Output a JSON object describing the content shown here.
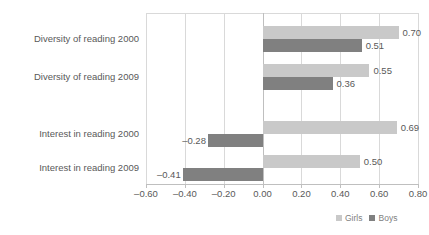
{
  "chart_data": {
    "type": "bar",
    "orientation": "horizontal",
    "title": "",
    "subtitle": "",
    "xlabel": "",
    "ylabel": "",
    "categories": [
      "Diversity of reading 2000",
      "Diversity of reading 2009",
      "Interest in reading 2000",
      "Interest in reading 2009"
    ],
    "series": [
      {
        "name": "Girls",
        "color": "#c9c9c9",
        "values": [
          0.7,
          0.55,
          0.69,
          0.5
        ]
      },
      {
        "name": "Boys",
        "color": "#808080",
        "values": [
          0.51,
          0.36,
          -0.28,
          -0.41
        ]
      }
    ],
    "data_labels": {
      "Girls": [
        "0.70",
        "0.55",
        "0.69",
        "0.50"
      ],
      "Boys": [
        "0.51",
        "0.36",
        "-0.28",
        "-0.41"
      ]
    },
    "xlim": [
      -0.6,
      0.8
    ],
    "xticks": [
      -0.6,
      -0.4,
      -0.2,
      0.0,
      0.2,
      0.4,
      0.6,
      0.8
    ],
    "xtick_labels": [
      "-0.60",
      "-0.40",
      "-0.20",
      "0.00",
      "0.20",
      "0.40",
      "0.60",
      "0.80"
    ],
    "grid": "vertical",
    "legend_position": "bottom-right",
    "legend": [
      "Girls",
      "Boys"
    ]
  }
}
